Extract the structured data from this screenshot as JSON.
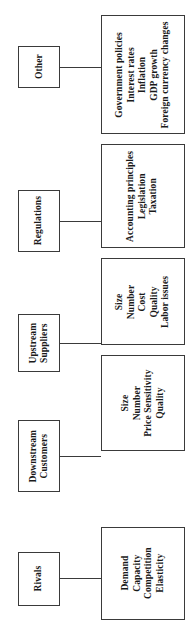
{
  "diagram": {
    "orientation": "rotated-90-ccw",
    "line_color": "#3a3a3a",
    "text_color": "#1a1a1a",
    "background": "#ffffff",
    "groups": [
      {
        "id": "other",
        "label": "Other",
        "items": [
          "Government policies",
          "Interest rates",
          "Inflation",
          "GDP growth",
          "Foreign currency changes"
        ],
        "label_box": {
          "x": 18,
          "y": 46,
          "w": 42,
          "h": 42
        },
        "content_box": {
          "x": 101,
          "y": 15,
          "w": 84,
          "h": 119
        },
        "connector": {
          "x": 60,
          "y": 67,
          "w": 41
        }
      },
      {
        "id": "regulations",
        "label": "Regulations",
        "items": [
          "Accounting principles",
          "Legislation",
          "Taxation"
        ],
        "label_box": {
          "x": 18,
          "y": 190,
          "w": 42,
          "h": 62
        },
        "content_box": {
          "x": 101,
          "y": 144,
          "w": 84,
          "h": 104
        },
        "connector": {
          "x": 60,
          "y": 221,
          "w": 41
        }
      },
      {
        "id": "upstream-suppliers",
        "label": "Upstream\nSuppliers",
        "label_lines": [
          "Upstream",
          "Suppliers"
        ],
        "items": [
          "Size",
          "Number",
          "Cost",
          "Quality",
          "Labor issues"
        ],
        "label_box": {
          "x": 18,
          "y": 314,
          "w": 42,
          "h": 58
        },
        "content_box": {
          "x": 101,
          "y": 258,
          "w": 84,
          "h": 87
        },
        "connector": {
          "x": 60,
          "y": 343,
          "w": 41
        }
      },
      {
        "id": "downstream-customers",
        "label": "Downstream\nCustomers",
        "label_lines": [
          "Downstream",
          "Customers"
        ],
        "items": [
          "Size",
          "Number",
          "Price Sensitivity",
          "Quality"
        ],
        "label_box": {
          "x": 18,
          "y": 420,
          "w": 42,
          "h": 72
        },
        "content_box": {
          "x": 101,
          "y": 355,
          "w": 84,
          "h": 96
        },
        "connector": {
          "x": 60,
          "y": 456,
          "w": 41
        }
      },
      {
        "id": "rivals",
        "label": "Rivals",
        "items": [
          "Demand",
          "Capacity",
          "Competition",
          "Elasticity"
        ],
        "label_box": {
          "x": 18,
          "y": 552,
          "w": 42,
          "h": 54
        },
        "content_box": {
          "x": 101,
          "y": 527,
          "w": 84,
          "h": 93
        },
        "connector": {
          "x": 60,
          "y": 578,
          "w": 41
        }
      }
    ]
  }
}
